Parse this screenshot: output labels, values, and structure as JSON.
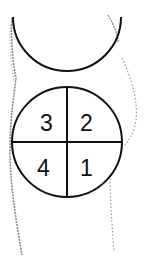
{
  "diagram": {
    "quadrants": [
      {
        "label": "3",
        "position": "upper-left"
      },
      {
        "label": "2",
        "position": "upper-right"
      },
      {
        "label": "4",
        "position": "lower-left"
      },
      {
        "label": "1",
        "position": "lower-right"
      }
    ],
    "colors": {
      "line": "#111111",
      "sketch": "#888888",
      "background": "#ffffff"
    }
  }
}
